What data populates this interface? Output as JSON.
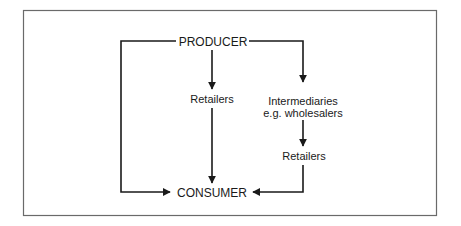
{
  "diagram": {
    "nodes": {
      "producer": "PRODUCER",
      "retailers_direct": "Retailers",
      "intermediaries_line1": "Intermediaries",
      "intermediaries_line2": "e.g. wholesalers",
      "retailers_indirect": "Retailers",
      "consumer": "CONSUMER"
    },
    "edges": [
      {
        "from": "PRODUCER",
        "to": "CONSUMER",
        "route": "left direct"
      },
      {
        "from": "PRODUCER",
        "to": "Retailers",
        "route": "center"
      },
      {
        "from": "Retailers",
        "to": "CONSUMER",
        "route": "center"
      },
      {
        "from": "PRODUCER",
        "to": "Intermediaries e.g. wholesalers",
        "route": "right"
      },
      {
        "from": "Intermediaries e.g. wholesalers",
        "to": "Retailers",
        "route": "right"
      },
      {
        "from": "Retailers",
        "to": "CONSUMER",
        "route": "right"
      }
    ],
    "colors": {
      "line": "#1a1a1a",
      "frame": "#6a6a6a",
      "background": "#ffffff"
    }
  }
}
